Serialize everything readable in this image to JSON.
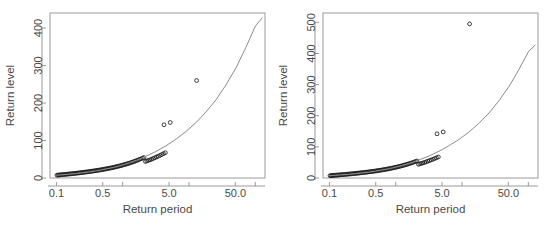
{
  "figure": {
    "panel_count": 2,
    "background_color": "#ffffff",
    "point_color": "#1a1a1a",
    "curve_color": "#8c8c8c",
    "axis_color": "#9a9a9a"
  },
  "chart_data": [
    {
      "type": "scatter",
      "panel": "left",
      "title": "",
      "xlabel": "Return period",
      "ylabel": "Return level",
      "xscale": "log",
      "yscale": "linear",
      "xlim": [
        0.08,
        140
      ],
      "ylim": [
        0,
        440
      ],
      "xticks": [
        0.1,
        0.5,
        5.0,
        50.0
      ],
      "xtick_labels": [
        "0.1",
        "0.5",
        "5.0",
        "50.0"
      ],
      "yticks": [
        0,
        100,
        200,
        300,
        400
      ],
      "ytick_labels": [
        "0",
        "100",
        "200",
        "300",
        "400"
      ],
      "grid": false,
      "legend": "none",
      "series": [
        {
          "name": "Empirical return levels",
          "marker": "open-circle",
          "x": [
            0.102,
            0.106,
            0.11,
            0.114,
            0.118,
            0.123,
            0.128,
            0.133,
            0.138,
            0.144,
            0.15,
            0.156,
            0.162,
            0.169,
            0.176,
            0.183,
            0.19,
            0.198,
            0.206,
            0.215,
            0.224,
            0.233,
            0.243,
            0.253,
            0.263,
            0.274,
            0.286,
            0.298,
            0.31,
            0.323,
            0.337,
            0.351,
            0.366,
            0.381,
            0.397,
            0.414,
            0.431,
            0.449,
            0.468,
            0.488,
            0.508,
            0.53,
            0.552,
            0.576,
            0.6,
            0.626,
            0.652,
            0.68,
            0.709,
            0.739,
            0.771,
            0.804,
            0.839,
            0.875,
            0.913,
            0.953,
            0.995,
            1.039,
            1.085,
            1.134,
            1.185,
            1.239,
            1.296,
            1.356,
            1.42,
            1.487,
            1.558,
            1.634,
            1.714,
            1.799,
            1.89,
            1.986,
            2.089,
            2.199,
            2.317,
            2.443,
            2.578,
            2.723,
            2.879,
            3.047,
            3.229,
            3.425,
            3.638,
            3.869,
            4.121,
            4.396
          ],
          "y": [
            7.5,
            7.8,
            8.0,
            8.3,
            8.6,
            8.9,
            9.2,
            9.5,
            9.8,
            10.1,
            10.4,
            10.7,
            11.0,
            11.4,
            11.7,
            12.0,
            12.4,
            12.7,
            13.1,
            13.4,
            13.8,
            14.2,
            14.6,
            15.0,
            15.4,
            15.8,
            16.2,
            16.6,
            17.0,
            17.5,
            17.9,
            18.4,
            18.8,
            19.3,
            19.8,
            20.3,
            20.8,
            21.3,
            21.8,
            22.4,
            22.9,
            23.5,
            24.1,
            24.7,
            25.3,
            25.9,
            26.6,
            27.2,
            27.9,
            28.6,
            29.4,
            30.1,
            30.9,
            31.7,
            32.5,
            33.4,
            34.3,
            35.2,
            36.2,
            37.2,
            38.2,
            39.3,
            40.4,
            41.6,
            42.8,
            44.1,
            45.4,
            46.8,
            48.2,
            49.7,
            51.3,
            52.9,
            54.6,
            44.0,
            45.5,
            47.0,
            48.5,
            50.0,
            52.0,
            54.0,
            56.0,
            58.0,
            60.0,
            62.5,
            65.0,
            67.5
          ]
        },
        {
          "name": "Outliers",
          "marker": "open-circle",
          "x": [
            4.2,
            5.2,
            13.0
          ],
          "y": [
            142,
            148,
            260
          ]
        },
        {
          "name": "Fitted model",
          "marker": "line",
          "x": [
            0.102,
            0.14,
            0.2,
            0.28,
            0.4,
            0.56,
            0.8,
            1.12,
            1.6,
            2.24,
            3.2,
            4.5,
            6.4,
            9.0,
            12.8,
            18.0,
            25.6,
            36.0,
            51.2,
            72.0,
            100.0,
            128.0
          ],
          "y": [
            7.5,
            9.5,
            12.0,
            15.0,
            19.0,
            24.0,
            30.0,
            37.5,
            47.0,
            58.0,
            71.0,
            86.0,
            104.0,
            124.0,
            148.0,
            176.0,
            209.0,
            248.0,
            294.0,
            348.0,
            405.0,
            428.0
          ]
        }
      ]
    },
    {
      "type": "scatter",
      "panel": "right",
      "title": "",
      "xlabel": "Return period",
      "ylabel": "Return level",
      "xscale": "log",
      "yscale": "linear",
      "xlim": [
        0.08,
        140
      ],
      "ylim": [
        0,
        530
      ],
      "xticks": [
        0.1,
        0.5,
        5.0,
        50.0
      ],
      "xtick_labels": [
        "0.1",
        "0.5",
        "5.0",
        "50.0"
      ],
      "yticks": [
        0,
        100,
        200,
        300,
        400,
        500
      ],
      "ytick_labels": [
        "0",
        "100",
        "200",
        "300",
        "400",
        "500"
      ],
      "grid": false,
      "legend": "none",
      "series": [
        {
          "name": "Empirical return levels",
          "marker": "open-circle",
          "x": [
            0.102,
            0.106,
            0.11,
            0.114,
            0.118,
            0.123,
            0.128,
            0.133,
            0.138,
            0.144,
            0.15,
            0.156,
            0.162,
            0.169,
            0.176,
            0.183,
            0.19,
            0.198,
            0.206,
            0.215,
            0.224,
            0.233,
            0.243,
            0.253,
            0.263,
            0.274,
            0.286,
            0.298,
            0.31,
            0.323,
            0.337,
            0.351,
            0.366,
            0.381,
            0.397,
            0.414,
            0.431,
            0.449,
            0.468,
            0.488,
            0.508,
            0.53,
            0.552,
            0.576,
            0.6,
            0.626,
            0.652,
            0.68,
            0.709,
            0.739,
            0.771,
            0.804,
            0.839,
            0.875,
            0.913,
            0.953,
            0.995,
            1.039,
            1.085,
            1.134,
            1.185,
            1.239,
            1.296,
            1.356,
            1.42,
            1.487,
            1.558,
            1.634,
            1.714,
            1.799,
            1.89,
            1.986,
            2.089,
            2.199,
            2.317,
            2.443,
            2.578,
            2.723,
            2.879,
            3.047,
            3.229,
            3.425,
            3.638,
            3.869,
            4.121,
            4.396
          ],
          "y": [
            7.5,
            7.8,
            8.0,
            8.3,
            8.6,
            8.9,
            9.2,
            9.5,
            9.8,
            10.1,
            10.4,
            10.7,
            11.0,
            11.4,
            11.7,
            12.0,
            12.4,
            12.7,
            13.1,
            13.4,
            13.8,
            14.2,
            14.6,
            15.0,
            15.4,
            15.8,
            16.2,
            16.6,
            17.0,
            17.5,
            17.9,
            18.4,
            18.8,
            19.3,
            19.8,
            20.3,
            20.8,
            21.3,
            21.8,
            22.4,
            22.9,
            23.5,
            24.1,
            24.7,
            25.3,
            25.9,
            26.6,
            27.2,
            27.9,
            28.6,
            29.4,
            30.1,
            30.9,
            31.7,
            32.5,
            33.4,
            34.3,
            35.2,
            36.2,
            37.2,
            38.2,
            39.3,
            40.4,
            41.6,
            42.8,
            44.1,
            45.4,
            46.8,
            48.2,
            49.7,
            51.3,
            52.9,
            54.6,
            44.0,
            45.5,
            47.0,
            48.5,
            50.0,
            52.0,
            54.0,
            56.0,
            58.0,
            60.0,
            62.5,
            65.0,
            67.5
          ]
        },
        {
          "name": "Outliers",
          "marker": "open-circle",
          "x": [
            4.2,
            5.2,
            13.0
          ],
          "y": [
            142,
            148,
            495
          ]
        },
        {
          "name": "Fitted model",
          "marker": "line",
          "x": [
            0.102,
            0.14,
            0.2,
            0.28,
            0.4,
            0.56,
            0.8,
            1.12,
            1.6,
            2.24,
            3.2,
            4.5,
            6.4,
            9.0,
            12.8,
            18.0,
            25.6,
            36.0,
            51.2,
            72.0,
            100.0,
            128.0
          ],
          "y": [
            7.5,
            9.5,
            12.0,
            15.0,
            19.0,
            24.0,
            30.0,
            37.5,
            47.0,
            58.0,
            71.0,
            86.0,
            104.0,
            124.0,
            148.0,
            176.0,
            209.0,
            248.0,
            294.0,
            348.0,
            405.0,
            428.0
          ]
        }
      ]
    }
  ]
}
